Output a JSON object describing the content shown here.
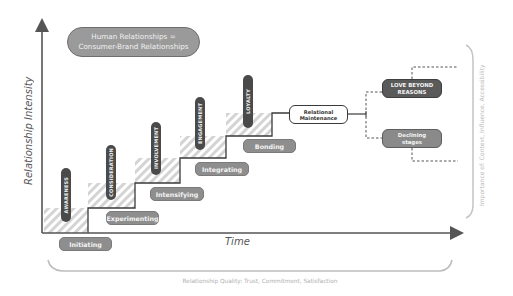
{
  "title": {
    "line1": "Human Relationships =",
    "line2": "Consumer-Brand Relationships"
  },
  "axes": {
    "y_label": "Relationship Intensity",
    "x_label": "Time"
  },
  "consumer_stages": [
    {
      "label": "AWARENESS"
    },
    {
      "label": "CONSIDERATION"
    },
    {
      "label": "INVOLVEMENT"
    },
    {
      "label": "ENGAGEMENT"
    },
    {
      "label": "LOYALTY"
    }
  ],
  "relationship_stages": [
    {
      "label": "Initiating"
    },
    {
      "label": "Experimenting"
    },
    {
      "label": "Intensifying"
    },
    {
      "label": "Integrating"
    },
    {
      "label": "Bonding"
    }
  ],
  "maintenance": {
    "line1": "Relational",
    "line2": "Maintenance"
  },
  "outcomes": {
    "positive": {
      "line1": "LOVE BEYOND",
      "line2": "REASONS"
    },
    "negative": {
      "line1": "Declining",
      "line2": "stages"
    }
  },
  "side_note": "Importance of: Context, Influence, Accessibility",
  "bottom_note": "Relationship Quality: Trust, Commitment, Satisfaction",
  "colors": {
    "dark_pillar": "#4a4a4a",
    "stage_pill": "#8e8e8e",
    "title_pill": "#9a9a9a",
    "love_box": "#5a5a5a",
    "declining_box": "#8a8a8a",
    "axis": "#555555",
    "hatch": "#d4d4d4"
  }
}
